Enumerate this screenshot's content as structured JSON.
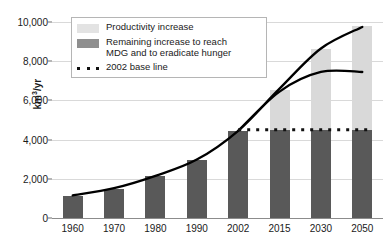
{
  "chart_data": {
    "type": "bar",
    "title": "",
    "subtitle": "",
    "xlabel": "",
    "ylabel": "km3/yr",
    "ylabel_base": "km",
    "ylabel_sup": "3",
    "ylabel_suffix": "/yr",
    "categories": [
      "1960",
      "1970",
      "1980",
      "1990",
      "2002",
      "2015",
      "2030",
      "2050"
    ],
    "ylim": [
      0,
      10000
    ],
    "ytick_values": [
      0,
      2000,
      4000,
      6000,
      8000,
      10000
    ],
    "ytick_labels": [
      "0",
      "2,000",
      "4,000",
      "6,000",
      "8,000",
      "10,000"
    ],
    "grid": true,
    "legend_position": "top-left",
    "stacked": true,
    "series": [
      {
        "name": "Remaining increase to reach MDG and to eradicate hunger",
        "color": "#595959",
        "values": [
          1120,
          1480,
          2150,
          2960,
          4440,
          4500,
          4500,
          4500
        ]
      },
      {
        "name": "Productivity increase",
        "color": "#d9d9d9",
        "values": [
          0,
          0,
          0,
          0,
          0,
          2050,
          4120,
          5280
        ]
      }
    ],
    "stack_totals": [
      1120,
      1480,
      2150,
      2960,
      4440,
      6550,
      8620,
      9780
    ],
    "reference_line": {
      "name": "2002 base line",
      "value": 4500,
      "style": "dotted",
      "color": "#111111",
      "x_start_category": "2002",
      "x_end_category": "2050"
    },
    "curves": [
      {
        "name": "upper-projection-curve",
        "color": "#000000",
        "points": [
          {
            "x": "1960",
            "y": 1150
          },
          {
            "x": "1970",
            "y": 1520
          },
          {
            "x": "1980",
            "y": 2150
          },
          {
            "x": "1990",
            "y": 2980
          },
          {
            "x": "2002",
            "y": 4450
          },
          {
            "x": "2015",
            "y": 6600
          },
          {
            "x": "2030",
            "y": 8650
          },
          {
            "x": "2050",
            "y": 9750
          }
        ]
      },
      {
        "name": "lower-projection-curve",
        "color": "#000000",
        "points": [
          {
            "x": "2002",
            "y": 4450
          },
          {
            "x": "2015",
            "y": 6450
          },
          {
            "x": "2030",
            "y": 7450
          },
          {
            "x": "2050",
            "y": 7450
          }
        ]
      }
    ]
  },
  "legend": {
    "items": [
      {
        "label": "Productivity increase",
        "swatch": "light"
      },
      {
        "label": "Remaining increase to reach\nMDG and to eradicate hunger",
        "swatch": "dark"
      },
      {
        "label": "2002 base line",
        "swatch": "dots"
      }
    ]
  }
}
